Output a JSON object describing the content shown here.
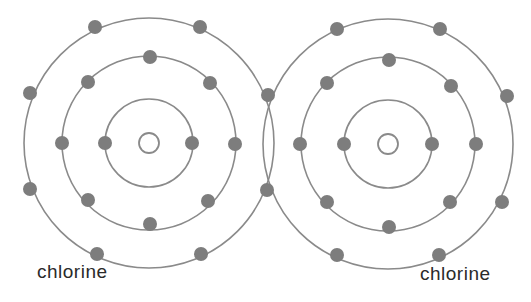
{
  "colors": {
    "orbit": "#8a8a8a",
    "electron": "#7d7d7d",
    "nucleus": "#8a8a8a",
    "text": "#2a2a2a"
  },
  "atoms": [
    {
      "name": "chlorine",
      "label": "chlorine",
      "cx": 149,
      "cy": 143,
      "nucleus_r": 10,
      "shells": [
        {
          "r": 44,
          "electrons": [
            [
              105,
              143
            ],
            [
              192,
              143
            ]
          ]
        },
        {
          "r": 87,
          "electrons": [
            [
              150,
              57
            ],
            [
              88,
              82
            ],
            [
              210,
              83
            ],
            [
              62,
              143
            ],
            [
              235,
              144
            ],
            [
              88,
              200
            ],
            [
              208,
              201
            ],
            [
              150,
              224
            ]
          ]
        },
        {
          "r": 125,
          "electrons": [
            [
              95,
              27
            ],
            [
              200,
              27
            ],
            [
              30,
              93
            ],
            [
              30,
              189
            ],
            [
              97,
              254
            ],
            [
              201,
              254
            ],
            [
              268,
              95
            ],
            [
              267,
              190
            ]
          ]
        }
      ]
    },
    {
      "name": "chlorine",
      "label": "chlorine",
      "cx": 388,
      "cy": 144,
      "nucleus_r": 10,
      "shells": [
        {
          "r": 44,
          "electrons": [
            [
              344,
              144
            ],
            [
              432,
              144
            ]
          ]
        },
        {
          "r": 87,
          "electrons": [
            [
              389,
              60
            ],
            [
              327,
              83
            ],
            [
              451,
              86
            ],
            [
              300,
              144
            ],
            [
              476,
              144
            ],
            [
              327,
              202
            ],
            [
              450,
              202
            ],
            [
              389,
              227
            ]
          ]
        },
        {
          "r": 125,
          "electrons": [
            [
              337,
              29
            ],
            [
              440,
              29
            ],
            [
              507,
              96
            ],
            [
              502,
              202
            ],
            [
              337,
              255
            ],
            [
              439,
              255
            ]
          ]
        }
      ]
    }
  ],
  "shared_pair": [
    [
      268,
      95
    ],
    [
      267,
      190
    ]
  ]
}
